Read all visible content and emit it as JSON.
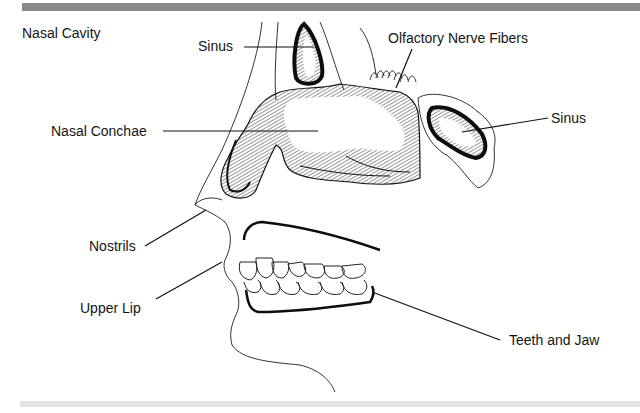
{
  "diagram": {
    "title": "Nasal Cavity",
    "labels": {
      "sinus_upper": "Sinus",
      "olfactory": "Olfactory Nerve Fibers",
      "sinus_right": "Sinus",
      "nasal_conchae": "Nasal Conchae",
      "nostrils": "Nostrils",
      "upper_lip": "Upper Lip",
      "teeth_jaw": "Teeth and Jaw"
    },
    "colors": {
      "top_bar": "#8a8a8a",
      "bottom_bar": "#e2e2e2",
      "ink": "#151515"
    }
  }
}
